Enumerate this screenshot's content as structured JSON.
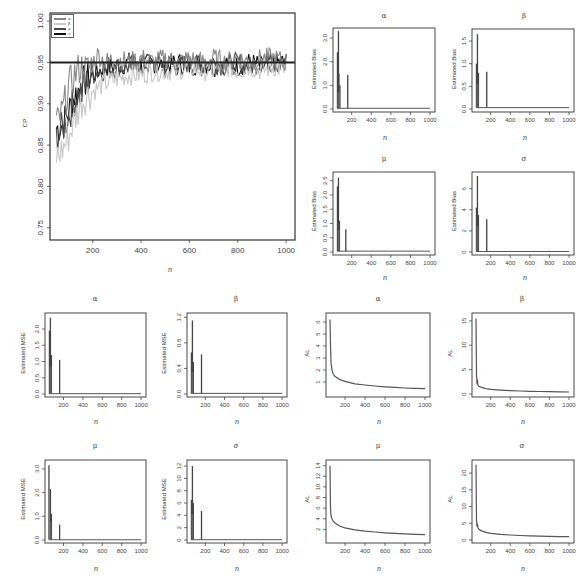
{
  "chart_data": [
    {
      "id": "cp",
      "type": "line",
      "title": "",
      "xlabel": "n",
      "ylabel": "CP",
      "xlim": [
        40,
        1020
      ],
      "ylim": [
        0.74,
        1.005
      ],
      "xticks": [
        200,
        400,
        600,
        800,
        1000
      ],
      "yticks": [
        0.75,
        0.8,
        0.85,
        0.9,
        0.95,
        1.0
      ],
      "ytick_labels": [
        "0.75",
        "0.80",
        "0.85",
        "0.90",
        "0.95",
        "1.00"
      ],
      "reference_line": 0.95,
      "legend": {
        "position": "top-left",
        "entries": [
          "α",
          "β",
          "μ",
          "σ"
        ]
      },
      "series": [
        {
          "name": "α",
          "color": "#888888",
          "x": [
            50,
            75,
            100,
            125,
            150,
            175,
            200,
            225,
            250,
            300,
            350,
            400,
            450,
            500,
            550,
            600,
            650,
            700,
            750,
            800,
            850,
            900,
            950,
            1000
          ],
          "values": [
            0.875,
            0.89,
            0.92,
            0.935,
            0.945,
            0.94,
            0.95,
            0.96,
            0.95,
            0.955,
            0.95,
            0.955,
            0.95,
            0.955,
            0.95,
            0.955,
            0.95,
            0.955,
            0.95,
            0.955,
            0.95,
            0.955,
            0.955,
            0.95
          ]
        },
        {
          "name": "β",
          "color": "#c8c8c8",
          "x": [
            50,
            75,
            100,
            125,
            150,
            175,
            200,
            225,
            250,
            300,
            350,
            400,
            450,
            500,
            550,
            600,
            650,
            700,
            750,
            800,
            850,
            900,
            950,
            1000
          ],
          "values": [
            0.835,
            0.845,
            0.86,
            0.88,
            0.9,
            0.91,
            0.915,
            0.92,
            0.925,
            0.93,
            0.935,
            0.935,
            0.94,
            0.94,
            0.94,
            0.945,
            0.94,
            0.94,
            0.945,
            0.94,
            0.945,
            0.94,
            0.945,
            0.94
          ]
        },
        {
          "name": "μ",
          "color": "#4a4a4a",
          "x": [
            50,
            75,
            100,
            125,
            150,
            175,
            200,
            225,
            250,
            300,
            350,
            400,
            450,
            500,
            550,
            600,
            650,
            700,
            750,
            800,
            850,
            900,
            950,
            1000
          ],
          "values": [
            0.86,
            0.87,
            0.885,
            0.905,
            0.915,
            0.925,
            0.935,
            0.94,
            0.94,
            0.945,
            0.945,
            0.95,
            0.945,
            0.95,
            0.945,
            0.95,
            0.945,
            0.95,
            0.945,
            0.95,
            0.945,
            0.95,
            0.95,
            0.945
          ]
        },
        {
          "name": "σ",
          "color": "#111111",
          "x": [
            50,
            75,
            100,
            125,
            150,
            175,
            200,
            225,
            250,
            300,
            350,
            400,
            450,
            500,
            550,
            600,
            650,
            700,
            750,
            800,
            850,
            900,
            950,
            1000
          ],
          "values": [
            0.87,
            0.875,
            0.89,
            0.91,
            0.92,
            0.93,
            0.935,
            0.94,
            0.945,
            0.945,
            0.95,
            0.945,
            0.95,
            0.945,
            0.95,
            0.945,
            0.95,
            0.945,
            0.95,
            0.945,
            0.95,
            0.945,
            0.95,
            0.95
          ]
        }
      ]
    },
    {
      "id": "bias_alpha",
      "type": "line",
      "title": "α",
      "xlabel": "n",
      "ylabel": "Estimated Bias",
      "xlim": [
        40,
        1020
      ],
      "ylim": [
        0,
        3.3
      ],
      "xticks": [
        200,
        400,
        600,
        800,
        1000
      ],
      "yticks": [
        0.0,
        1.0,
        2.0,
        3.0
      ],
      "ytick_labels": [
        "0.0",
        "1.0",
        "2.0",
        "3.0"
      ],
      "spikes": [
        {
          "x": 55,
          "y": 2.4
        },
        {
          "x": 65,
          "y": 3.3
        },
        {
          "x": 70,
          "y": 1.5
        },
        {
          "x": 80,
          "y": 1.0
        },
        {
          "x": 160,
          "y": 1.45
        }
      ],
      "baseline": 0.03
    },
    {
      "id": "bias_beta",
      "type": "line",
      "title": "β",
      "xlabel": "n",
      "ylabel": "Estimated Bias",
      "xlim": [
        40,
        1020
      ],
      "ylim": [
        0,
        1.7
      ],
      "xticks": [
        200,
        400,
        600,
        800,
        1000
      ],
      "yticks": [
        0.0,
        0.5,
        1.0,
        1.5
      ],
      "ytick_labels": [
        "0.0",
        "0.5",
        "1.0",
        "1.5"
      ],
      "spikes": [
        {
          "x": 55,
          "y": 1.0
        },
        {
          "x": 65,
          "y": 1.65
        },
        {
          "x": 75,
          "y": 0.8
        },
        {
          "x": 160,
          "y": 0.82
        }
      ],
      "baseline": 0.03
    },
    {
      "id": "bias_mu",
      "type": "line",
      "title": "μ",
      "xlabel": "n",
      "ylabel": "Estimated Bias",
      "xlim": [
        40,
        1020
      ],
      "ylim": [
        0,
        2.7
      ],
      "xticks": [
        200,
        400,
        600,
        800,
        1000
      ],
      "yticks": [
        0.0,
        0.5,
        1.0,
        1.5,
        2.0,
        2.5
      ],
      "ytick_labels": [
        "0.0",
        "0.5",
        "1.0",
        "1.5",
        "2.0",
        "2.5"
      ],
      "spikes": [
        {
          "x": 55,
          "y": 2.3
        },
        {
          "x": 65,
          "y": 2.6
        },
        {
          "x": 75,
          "y": 1.1
        },
        {
          "x": 140,
          "y": 0.8
        }
      ],
      "baseline": 0.03
    },
    {
      "id": "bias_sigma",
      "type": "line",
      "title": "σ",
      "xlabel": "n",
      "ylabel": "Estimated Bias",
      "xlim": [
        40,
        1020
      ],
      "ylim": [
        0,
        7.3
      ],
      "xticks": [
        200,
        400,
        600,
        800,
        1000
      ],
      "yticks": [
        0,
        2,
        4,
        6
      ],
      "ytick_labels": [
        "0",
        "2",
        "4",
        "6"
      ],
      "spikes": [
        {
          "x": 55,
          "y": 4.2
        },
        {
          "x": 65,
          "y": 7.2
        },
        {
          "x": 75,
          "y": 3.5
        },
        {
          "x": 160,
          "y": 3.1
        }
      ],
      "baseline": 0.05
    },
    {
      "id": "mse_alpha",
      "type": "line",
      "title": "α",
      "xlabel": "n",
      "ylabel": "Estimated MSE",
      "xlim": [
        40,
        1020
      ],
      "ylim": [
        0,
        2.4
      ],
      "xticks": [
        200,
        400,
        600,
        800,
        1000
      ],
      "yticks": [
        0.0,
        0.5,
        1.0,
        1.5,
        2.0
      ],
      "ytick_labels": [
        "0.0",
        "0.5",
        "1.0",
        "1.5",
        "2.0"
      ],
      "spikes": [
        {
          "x": 55,
          "y": 1.95
        },
        {
          "x": 65,
          "y": 2.35
        },
        {
          "x": 75,
          "y": 1.2
        },
        {
          "x": 160,
          "y": 1.05
        }
      ],
      "baseline": 0.01
    },
    {
      "id": "mse_beta",
      "type": "line",
      "title": "β",
      "xlabel": "n",
      "ylabel": "Estimated MSE",
      "xlim": [
        40,
        1020
      ],
      "ylim": [
        0,
        1.22
      ],
      "xticks": [
        200,
        400,
        600,
        800,
        1000
      ],
      "yticks": [
        0.0,
        0.4,
        0.8,
        1.2
      ],
      "ytick_labels": [
        "0.0",
        "0.4",
        "0.8",
        "1.2"
      ],
      "spikes": [
        {
          "x": 55,
          "y": 0.65
        },
        {
          "x": 65,
          "y": 1.15
        },
        {
          "x": 75,
          "y": 0.5
        },
        {
          "x": 160,
          "y": 0.62
        }
      ],
      "baseline": 0.01
    },
    {
      "id": "mse_mu",
      "type": "line",
      "title": "μ",
      "xlabel": "n",
      "ylabel": "Estimated MSE",
      "xlim": [
        40,
        1020
      ],
      "ylim": [
        0,
        3.25
      ],
      "xticks": [
        200,
        400,
        600,
        800,
        1000
      ],
      "yticks": [
        0.0,
        1.0,
        2.0,
        3.0
      ],
      "ytick_labels": [
        "0.0",
        "1.0",
        "2.0",
        "3.0"
      ],
      "spikes": [
        {
          "x": 50,
          "y": 3.15
        },
        {
          "x": 65,
          "y": 2.15
        },
        {
          "x": 75,
          "y": 1.1
        },
        {
          "x": 160,
          "y": 0.65
        }
      ],
      "baseline": 0.01
    },
    {
      "id": "mse_sigma",
      "type": "line",
      "title": "σ",
      "xlabel": "n",
      "ylabel": "Estimated MSE",
      "xlim": [
        40,
        1020
      ],
      "ylim": [
        0,
        12.5
      ],
      "xticks": [
        200,
        400,
        600,
        800,
        1000
      ],
      "yticks": [
        0,
        2,
        4,
        6,
        8,
        10,
        12
      ],
      "ytick_labels": [
        "0",
        "2",
        "4",
        "6",
        "8",
        "10",
        "12"
      ],
      "spikes": [
        {
          "x": 55,
          "y": 6.5
        },
        {
          "x": 65,
          "y": 12.0
        },
        {
          "x": 75,
          "y": 6.0
        },
        {
          "x": 160,
          "y": 4.7
        }
      ],
      "baseline": 0.05
    },
    {
      "id": "al_alpha",
      "type": "line",
      "title": "α",
      "xlabel": "n",
      "ylabel": "AL",
      "xlim": [
        40,
        1020
      ],
      "ylim": [
        0,
        6.5
      ],
      "xticks": [
        200,
        400,
        600,
        800,
        1000
      ],
      "yticks": [
        1,
        2,
        3,
        4,
        5,
        6
      ],
      "ytick_labels": [
        "1",
        "2",
        "3",
        "4",
        "5",
        "6"
      ],
      "curve": {
        "x": [
          50,
          55,
          60,
          70,
          80,
          100,
          150,
          200,
          300,
          400,
          500,
          600,
          700,
          800,
          900,
          1000
        ],
        "values": [
          6.2,
          4.0,
          2.6,
          2.0,
          1.7,
          1.45,
          1.2,
          1.05,
          0.85,
          0.75,
          0.67,
          0.6,
          0.55,
          0.5,
          0.47,
          0.44
        ]
      }
    },
    {
      "id": "al_beta",
      "type": "line",
      "title": "β",
      "xlabel": "n",
      "ylabel": "AL",
      "xlim": [
        40,
        1020
      ],
      "ylim": [
        0,
        16
      ],
      "xticks": [
        200,
        400,
        600,
        800,
        1000
      ],
      "yticks": [
        0,
        5,
        10,
        15
      ],
      "ytick_labels": [
        "0",
        "5",
        "10",
        "15"
      ],
      "curve": {
        "x": [
          50,
          55,
          60,
          65,
          70,
          80,
          100,
          150,
          200,
          300,
          400,
          500,
          600,
          700,
          800,
          900,
          1000
        ],
        "values": [
          15.5,
          4.0,
          2.0,
          3.0,
          1.8,
          1.6,
          1.4,
          1.1,
          0.95,
          0.8,
          0.7,
          0.62,
          0.56,
          0.52,
          0.48,
          0.45,
          0.42
        ]
      }
    },
    {
      "id": "al_mu",
      "type": "line",
      "title": "μ",
      "xlabel": "n",
      "ylabel": "AL",
      "xlim": [
        40,
        1020
      ],
      "ylim": [
        0,
        14.5
      ],
      "xticks": [
        200,
        400,
        600,
        800,
        1000
      ],
      "yticks": [
        2,
        4,
        6,
        8,
        10,
        12,
        14
      ],
      "ytick_labels": [
        "2",
        "4",
        "6",
        "8",
        "10",
        "12",
        "14"
      ],
      "curve": {
        "x": [
          50,
          55,
          60,
          70,
          80,
          100,
          150,
          200,
          300,
          400,
          500,
          600,
          700,
          800,
          900,
          1000
        ],
        "values": [
          14,
          6,
          4.6,
          4.0,
          3.6,
          3.2,
          2.6,
          2.3,
          1.9,
          1.65,
          1.5,
          1.35,
          1.25,
          1.15,
          1.08,
          1.0
        ]
      }
    },
    {
      "id": "al_sigma",
      "type": "line",
      "title": "σ",
      "xlabel": "n",
      "ylabel": "AL",
      "xlim": [
        40,
        1020
      ],
      "ylim": [
        0,
        23
      ],
      "xticks": [
        200,
        400,
        600,
        800,
        1000
      ],
      "yticks": [
        0,
        5,
        10,
        15,
        20
      ],
      "ytick_labels": [
        "0",
        "5",
        "10",
        "15",
        "20"
      ],
      "curve": {
        "x": [
          50,
          55,
          60,
          65,
          70,
          80,
          100,
          150,
          200,
          300,
          400,
          500,
          600,
          700,
          800,
          900,
          1000
        ],
        "values": [
          22.5,
          6.0,
          4.0,
          5.0,
          3.6,
          3.2,
          2.8,
          2.3,
          2.0,
          1.7,
          1.5,
          1.35,
          1.25,
          1.15,
          1.08,
          1.02,
          0.98
        ]
      }
    }
  ],
  "panels": {
    "cp": {
      "title": "",
      "xlabel": "n",
      "ylabel": "CP"
    },
    "bias_alpha": {
      "title": "α",
      "xlabel": "n",
      "ylabel": "Estimated Bias"
    },
    "bias_beta": {
      "title": "β",
      "xlabel": "n",
      "ylabel": "Estimated Bias"
    },
    "bias_mu": {
      "title": "μ",
      "xlabel": "n",
      "ylabel": "Estimated Bias"
    },
    "bias_sigma": {
      "title": "σ",
      "xlabel": "n",
      "ylabel": "Estimated Bias"
    },
    "mse_alpha": {
      "title": "α",
      "xlabel": "n",
      "ylabel": "Estimated MSE"
    },
    "mse_beta": {
      "title": "β",
      "xlabel": "n",
      "ylabel": "Estimated MSE"
    },
    "mse_mu": {
      "title": "μ",
      "xlabel": "n",
      "ylabel": "Estimated MSE"
    },
    "mse_sigma": {
      "title": "σ",
      "xlabel": "n",
      "ylabel": "Estimated MSE"
    },
    "al_alpha": {
      "title": "α",
      "xlabel": "n",
      "ylabel": "AL"
    },
    "al_beta": {
      "title": "β",
      "xlabel": "n",
      "ylabel": "AL"
    },
    "al_mu": {
      "title": "μ",
      "xlabel": "n",
      "ylabel": "AL"
    },
    "al_sigma": {
      "title": "σ",
      "xlabel": "n",
      "ylabel": "AL"
    }
  },
  "legend": {
    "entries": [
      {
        "label": "α",
        "color": "#888888"
      },
      {
        "label": "β",
        "color": "#c8c8c8"
      },
      {
        "label": "μ",
        "color": "#4a4a4a"
      },
      {
        "label": "σ",
        "color": "#111111"
      }
    ]
  },
  "colors": {
    "frame": "#333333",
    "line": "#555555",
    "spike": "#444444",
    "reference": "#222222"
  }
}
